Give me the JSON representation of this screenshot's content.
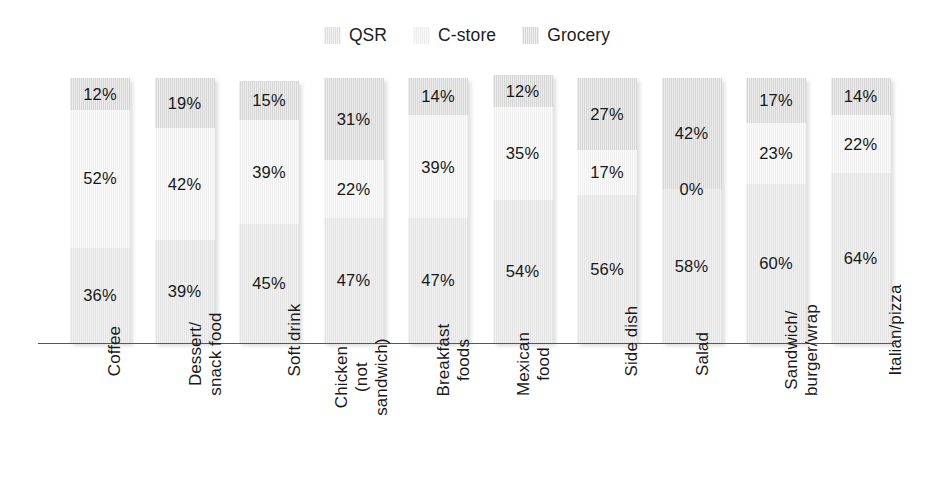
{
  "legend": {
    "entries": [
      {
        "label": "QSR",
        "swatch": "qsr-swatch",
        "color": "#dedede"
      },
      {
        "label": "C-store",
        "swatch": "cstore-swatch",
        "color": "#eeeeee"
      },
      {
        "label": "Grocery",
        "swatch": "grocery-swatch",
        "color": "#d6d6d6"
      }
    ]
  },
  "chart_data": {
    "type": "bar",
    "stacked": true,
    "orientation": "vertical",
    "title": "",
    "subtitle": "",
    "xlabel": "",
    "ylabel": "",
    "ylim": [
      0,
      100
    ],
    "grid": false,
    "legend_position": "top-center",
    "value_suffix": "%",
    "categories": [
      "Coffee",
      "Dessert/ snack food",
      "Soft drink",
      "Chicken (not sandwich)",
      "Breakfast foods",
      "Mexican food",
      "Side dish",
      "Salad",
      "Sandwich/ burger/wrap",
      "Italian/pizza"
    ],
    "category_lines": [
      [
        "Coffee"
      ],
      [
        "Dessert/",
        "snack food"
      ],
      [
        "Soft drink"
      ],
      [
        "Chicken",
        "(not",
        "sandwich)"
      ],
      [
        "Breakfast",
        "foods"
      ],
      [
        "Mexican",
        "food"
      ],
      [
        "Side dish"
      ],
      [
        "Salad"
      ],
      [
        "Sandwich/",
        "burger/wrap"
      ],
      [
        "Italian/pizza"
      ]
    ],
    "series": [
      {
        "name": "QSR",
        "stack_order": "bottom",
        "color": "#e3e3e3",
        "values": [
          36,
          39,
          45,
          47,
          47,
          54,
          56,
          58,
          60,
          64
        ]
      },
      {
        "name": "C-store",
        "stack_order": "middle",
        "color": "#f0f0f0",
        "values": [
          52,
          42,
          39,
          22,
          39,
          35,
          17,
          0,
          23,
          22
        ]
      },
      {
        "name": "Grocery",
        "stack_order": "top",
        "color": "#d6d6d6",
        "values": [
          12,
          19,
          15,
          31,
          14,
          12,
          27,
          42,
          17,
          14
        ]
      }
    ],
    "labels": [
      {
        "category": "Coffee",
        "Grocery": "12%",
        "C-store": "52%",
        "QSR": "36%"
      },
      {
        "category": "Dessert/ snack food",
        "Grocery": "19%",
        "C-store": "42%",
        "QSR": "39%"
      },
      {
        "category": "Soft drink",
        "Grocery": "15%",
        "C-store": "39%",
        "QSR": "45%"
      },
      {
        "category": "Chicken (not sandwich)",
        "Grocery": "31%",
        "C-store": "22%",
        "QSR": "47%"
      },
      {
        "category": "Breakfast foods",
        "Grocery": "14%",
        "C-store": "39%",
        "QSR": "47%"
      },
      {
        "category": "Mexican food",
        "Grocery": "12%",
        "C-store": "35%",
        "QSR": "54%"
      },
      {
        "category": "Side dish",
        "Grocery": "27%",
        "C-store": "17%",
        "QSR": "56%"
      },
      {
        "category": "Salad",
        "Grocery": "42%",
        "C-store": "0%",
        "QSR": "58%"
      },
      {
        "category": "Sandwich/ burger/wrap",
        "Grocery": "17%",
        "C-store": "23%",
        "QSR": "60%"
      },
      {
        "category": "Italian/pizza",
        "Grocery": "14%",
        "C-store": "22%",
        "QSR": "64%"
      }
    ]
  },
  "axis": {
    "baseline_color": "#56575a"
  }
}
